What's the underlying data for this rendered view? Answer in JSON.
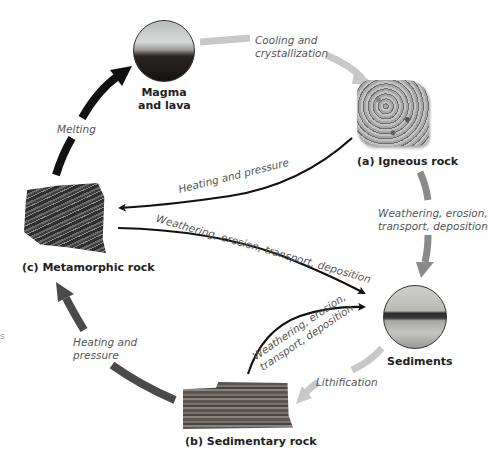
{
  "nodes": {
    "magma": {
      "label_line1": "Magma",
      "label_line2": "and lava"
    },
    "igneous": {
      "label": "(a) Igneous rock"
    },
    "sediments": {
      "label": "Sediments"
    },
    "sedimentary": {
      "label": "(b) Sedimentary rock"
    },
    "metamorphic": {
      "label": "(c) Metamorphic rock"
    }
  },
  "processes": {
    "cooling": {
      "line1": "Cooling and",
      "line2": "crystallization"
    },
    "weathering_igneous": {
      "line1": "Weathering, erosion,",
      "line2": "transport, deposition"
    },
    "lithification": {
      "text": "Lithification"
    },
    "heating_sedimentary": {
      "line1": "Heating and",
      "line2": "pressure"
    },
    "melting": {
      "text": "Melting"
    },
    "heating_igneous": {
      "text": "Heating and pressure"
    },
    "weathering_metamorphic": {
      "text": "Weathering, erosion, transport, deposition"
    },
    "weathering_sedimentary": {
      "line1": "Weathering, erosion,",
      "line2": "transport, deposition"
    }
  },
  "stray_text": "s",
  "colors": {
    "light_arrow": "#c8c8c8",
    "medium_arrow": "#8a8a8a",
    "dark_arrow": "#4a4a4a",
    "black_arrow": "#111111"
  }
}
